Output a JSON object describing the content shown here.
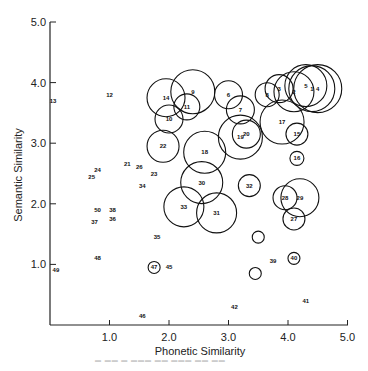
{
  "chart_data": {
    "type": "scatter",
    "title": "",
    "xlabel": "Phonetic Similarity",
    "ylabel": "Semantic Similarity",
    "xlim": [
      0,
      5.0
    ],
    "ylim": [
      0,
      5.0
    ],
    "xticks": [
      "1.0",
      "2.0",
      "3.0",
      "4.0",
      "5.0"
    ],
    "yticks": [
      "1.0",
      "2.0",
      "3.0",
      "4.0",
      "5.0"
    ],
    "grid": false,
    "legend": null,
    "note": "Numbered items; circled items drawn with circle radius proportional to a third variable",
    "points": [
      {
        "id": "1",
        "x": 4.4,
        "y": 3.9,
        "r": 23
      },
      {
        "id": "2",
        "x": 4.1,
        "y": 3.85,
        "r": 20
      },
      {
        "id": "3",
        "x": 3.85,
        "y": 3.9,
        "r": 14
      },
      {
        "id": "4",
        "x": 4.5,
        "y": 3.9,
        "r": 24
      },
      {
        "id": "5",
        "x": 4.3,
        "y": 3.95,
        "r": 21
      },
      {
        "id": "6",
        "x": 3.0,
        "y": 3.8,
        "r": 14
      },
      {
        "id": "7",
        "x": 3.2,
        "y": 3.55,
        "r": 14
      },
      {
        "id": "8",
        "x": 3.65,
        "y": 3.8,
        "r": 12
      },
      {
        "id": "9",
        "x": 2.4,
        "y": 3.85,
        "r": 22
      },
      {
        "id": "10",
        "x": 2.0,
        "y": 3.4,
        "r": 14
      },
      {
        "id": "11",
        "x": 2.3,
        "y": 3.6,
        "r": 13
      },
      {
        "id": "12",
        "x": 1.0,
        "y": 3.8,
        "r": 0
      },
      {
        "id": "13",
        "x": 0.05,
        "y": 3.7,
        "r": 0
      },
      {
        "id": "14",
        "x": 1.95,
        "y": 3.75,
        "r": 19
      },
      {
        "id": "15",
        "x": 4.15,
        "y": 3.15,
        "r": 11
      },
      {
        "id": "16",
        "x": 4.15,
        "y": 2.75,
        "r": 7
      },
      {
        "id": "17",
        "x": 3.9,
        "y": 3.35,
        "r": 22
      },
      {
        "id": "18",
        "x": 2.6,
        "y": 2.85,
        "r": 21
      },
      {
        "id": "19",
        "x": 3.2,
        "y": 3.1,
        "r": 22
      },
      {
        "id": "20",
        "x": 3.3,
        "y": 3.15,
        "r": 14
      },
      {
        "id": "21",
        "x": 1.3,
        "y": 2.65,
        "r": 0
      },
      {
        "id": "22",
        "x": 1.9,
        "y": 2.95,
        "r": 16
      },
      {
        "id": "23",
        "x": 1.75,
        "y": 2.5,
        "r": 0
      },
      {
        "id": "24",
        "x": 0.8,
        "y": 2.55,
        "r": 0
      },
      {
        "id": "25",
        "x": 0.7,
        "y": 2.45,
        "r": 0
      },
      {
        "id": "26",
        "x": 1.5,
        "y": 2.6,
        "r": 0
      },
      {
        "id": "27",
        "x": 4.1,
        "y": 1.75,
        "r": 11
      },
      {
        "id": "28",
        "x": 3.95,
        "y": 2.1,
        "r": 12
      },
      {
        "id": "29",
        "x": 4.2,
        "y": 2.1,
        "r": 19
      },
      {
        "id": "30",
        "x": 2.55,
        "y": 2.35,
        "r": 21
      },
      {
        "id": "31",
        "x": 2.8,
        "y": 1.85,
        "r": 20
      },
      {
        "id": "32",
        "x": 3.35,
        "y": 2.3,
        "r": 11
      },
      {
        "id": "33",
        "x": 2.25,
        "y": 1.95,
        "r": 20
      },
      {
        "id": "34",
        "x": 1.55,
        "y": 2.3,
        "r": 0
      },
      {
        "id": "35",
        "x": 1.8,
        "y": 1.45,
        "r": 0
      },
      {
        "id": "36",
        "x": 1.05,
        "y": 1.75,
        "r": 0
      },
      {
        "id": "37",
        "x": 0.75,
        "y": 1.7,
        "r": 0
      },
      {
        "id": "38",
        "x": 1.05,
        "y": 1.9,
        "r": 0
      },
      {
        "id": "39",
        "x": 3.75,
        "y": 1.05,
        "r": 0
      },
      {
        "id": "40",
        "x": 4.1,
        "y": 1.1,
        "r": 6
      },
      {
        "id": "41",
        "x": 4.3,
        "y": 0.4,
        "r": 0
      },
      {
        "id": "42",
        "x": 3.1,
        "y": 0.3,
        "r": 0
      },
      {
        "id": "45",
        "x": 2.0,
        "y": 0.95,
        "r": 0
      },
      {
        "id": "46",
        "x": 1.55,
        "y": 0.15,
        "r": 0
      },
      {
        "id": "47",
        "x": 1.75,
        "y": 0.95,
        "r": 6
      },
      {
        "id": "48",
        "x": 0.8,
        "y": 1.1,
        "r": 0
      },
      {
        "id": "49",
        "x": 0.1,
        "y": 0.9,
        "r": 0
      },
      {
        "id": "50",
        "x": 0.8,
        "y": 1.9,
        "r": 0
      },
      {
        "id": "",
        "x": 3.5,
        "y": 1.45,
        "r": 6
      },
      {
        "id": "",
        "x": 3.45,
        "y": 0.85,
        "r": 6
      }
    ]
  },
  "axes": {
    "x_title": "Phonetic Similarity",
    "y_title": "Semantic Similarity",
    "x_ticks": [
      "1.0",
      "2.0",
      "3.0",
      "4.0",
      "5.0"
    ],
    "y_ticks": [
      "1.0",
      "2.0",
      "3.0",
      "4.0",
      "5.0"
    ]
  },
  "colors": {
    "ink": "#111111",
    "background": "#ffffff"
  }
}
